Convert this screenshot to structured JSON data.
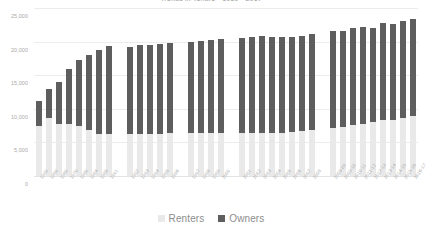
{
  "chart_data": {
    "type": "bar",
    "title": "Trends in Tenure - 1939 - 2017",
    "xlabel": "",
    "ylabel": "",
    "ylim": [
      0,
      25000
    ],
    "ytick_labels": [
      "25,000",
      "20,000",
      "15,000",
      "10,000",
      "5,000",
      "0"
    ],
    "ytick_values": [
      25000,
      20000,
      15000,
      10000,
      5000,
      0
    ],
    "grid": true,
    "stacked": true,
    "legend_position": "bottom",
    "legend": [
      "Renters",
      "Owners"
    ],
    "colors": {
      "renters": "#e9e9e9",
      "owners": "#5e5e5e",
      "gridline": "#ececec",
      "axis_text": "#a8a8a8",
      "title_text": "#9a9a9a",
      "legend_text": "#8e8e8e",
      "background": "#ffffff"
    },
    "categories": [
      "1939",
      "1950",
      "1960",
      "1970",
      "1980",
      "1984",
      "1988",
      "1991",
      "1992",
      "1993",
      "1994",
      "1995",
      "1996",
      "1997",
      "1998",
      "1999",
      "2000",
      "2001",
      "2002",
      "2003",
      "2004",
      "2005",
      "2006",
      "2007",
      "2008",
      "2008-09",
      "2009-10",
      "2010-11",
      "2011-12",
      "2012-13",
      "2013-14",
      "2014-15",
      "2015-16",
      "2016-17"
    ],
    "group_breaks": [
      8,
      13,
      17,
      25
    ],
    "series": [
      {
        "name": "Renters",
        "color": "#e9e9e9",
        "values": [
          7500,
          8600,
          7800,
          7700,
          7400,
          6800,
          6300,
          6300,
          6300,
          6300,
          6300,
          6300,
          6350,
          6400,
          6400,
          6350,
          6400,
          6400,
          6350,
          6350,
          6400,
          6450,
          6500,
          6700,
          6900,
          7100,
          7300,
          7600,
          7800,
          8000,
          8300,
          8300,
          8600,
          8900
        ]
      },
      {
        "name": "Owners",
        "color": "#5e5e5e",
        "values": [
          3600,
          4300,
          6200,
          8300,
          9900,
          11200,
          12400,
          13100,
          12900,
          13200,
          13250,
          13300,
          13450,
          13600,
          13750,
          13900,
          14000,
          14100,
          14400,
          14450,
          14350,
          14300,
          14250,
          14150,
          14200,
          14500,
          14300,
          14400,
          14400,
          14100,
          14500,
          14300,
          14400,
          14400
        ]
      }
    ],
    "totals": [
      11100,
      12900,
      14000,
      16000,
      17300,
      18000,
      18700,
      19400,
      19200,
      19500,
      19550,
      19600,
      19800,
      20000,
      20150,
      20250,
      20400,
      20500,
      20750,
      20800,
      20750,
      20750,
      20750,
      20850,
      21100,
      21600,
      21600,
      22000,
      22200,
      22100,
      22800,
      22600,
      23000,
      23300
    ]
  }
}
